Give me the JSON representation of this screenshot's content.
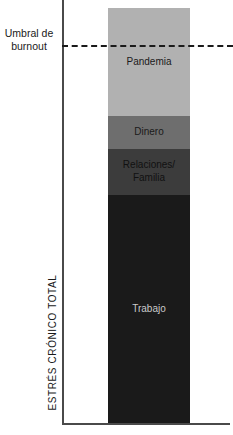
{
  "chart_data": {
    "type": "bar",
    "title": "",
    "subtitle": "",
    "xlabel": "",
    "ylabel": "ESTRÉS CRÓNICO TOTAL",
    "stacked": true,
    "grid": false,
    "legend": "none",
    "axis": {
      "y_title": "ESTRÉS CRÓNICO TOTAL",
      "y_tick_labels": [],
      "x_tick_labels": [],
      "ylim": [
        0,
        100
      ]
    },
    "categories": [
      "Estrés crónico total"
    ],
    "series": [
      {
        "name": "Trabajo",
        "values": [
          55
        ]
      },
      {
        "name": "Relaciones/\nFamilia",
        "values": [
          11
        ]
      },
      {
        "name": "Dinero",
        "values": [
          8
        ]
      },
      {
        "name": "Pandemia",
        "values": [
          26
        ]
      }
    ],
    "segments": [
      {
        "label": "Pandemia",
        "value": 26,
        "color": "#b1b1b1",
        "text_color": "#1a1a1a"
      },
      {
        "label": "Dinero",
        "value": 8,
        "color": "#6e6e6e",
        "text_color": "#1a1a1a"
      },
      {
        "label": "Relaciones/\nFamilia",
        "value": 11,
        "color": "#3c3c3c",
        "text_color": "#111111"
      },
      {
        "label": "Trabajo",
        "value": 55,
        "color": "#1a1a1a",
        "text_color": "#c9c9c9"
      }
    ],
    "annotations": [
      {
        "name": "burnout-threshold",
        "label": "Umbral de\nburnout",
        "value": 91,
        "style": "dashed",
        "color": "#1a1a1a"
      }
    ]
  },
  "colors": {
    "background": "#ffffff",
    "axis": "#4a4a4a",
    "threshold": "#1a1a1a"
  }
}
